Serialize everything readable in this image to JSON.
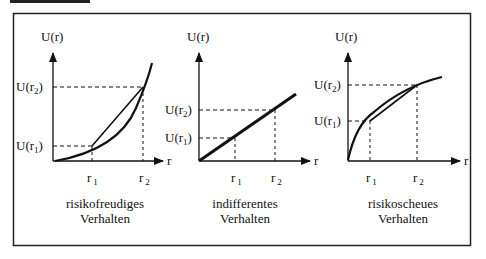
{
  "heading": {
    "text": "",
    "note": "heading text cropped at top edge"
  },
  "panels": [
    {
      "id": "risk-seeking",
      "y_axis_label": "U(r)",
      "x_axis_label": "r",
      "ticks_x": [
        {
          "base": "r",
          "sub": "1"
        },
        {
          "base": "r",
          "sub": "2"
        }
      ],
      "ticks_y": [
        {
          "base": "U(r",
          "sub": "2",
          "close": ")"
        },
        {
          "base": "U(r",
          "sub": "1",
          "close": ")"
        }
      ],
      "caption_line1": "risikofreudiges",
      "caption_line2": "Verhalten",
      "curve": "convex"
    },
    {
      "id": "risk-neutral",
      "y_axis_label": "U(r)",
      "x_axis_label": "r",
      "ticks_x": [
        {
          "base": "r",
          "sub": "1"
        },
        {
          "base": "r",
          "sub": "2"
        }
      ],
      "ticks_y": [
        {
          "base": "U(r",
          "sub": "2",
          "close": ")"
        },
        {
          "base": "U(r",
          "sub": "1",
          "close": ")"
        }
      ],
      "caption_line1": "indifferentes",
      "caption_line2": "Verhalten",
      "curve": "linear"
    },
    {
      "id": "risk-averse",
      "y_axis_label": "U(r)",
      "x_axis_label": "r",
      "ticks_x": [
        {
          "base": "r",
          "sub": "1"
        },
        {
          "base": "r",
          "sub": "2"
        }
      ],
      "ticks_y": [
        {
          "base": "U(r",
          "sub": "2",
          "close": ")"
        },
        {
          "base": "U(r",
          "sub": "1",
          "close": ")"
        }
      ],
      "caption_line1": "risikoscheues",
      "caption_line2": "Verhalten",
      "curve": "concave"
    }
  ]
}
